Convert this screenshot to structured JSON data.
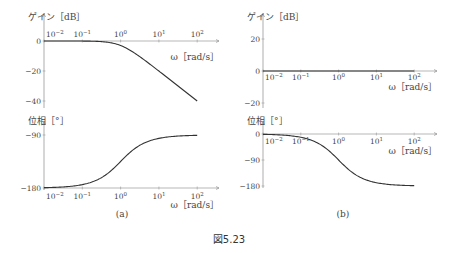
{
  "figure": {
    "caption": "図5.23",
    "panels": [
      {
        "id": "a",
        "label": "(a)"
      },
      {
        "id": "b",
        "label": "(b)"
      }
    ]
  },
  "chart_data": [
    {
      "type": "line",
      "panel": "(a)",
      "title": "ゲイン [dB]",
      "xlabel": "ω [rad/s]",
      "ylabel": "ゲイン [dB]",
      "xscale": "log",
      "xticks": [
        "10^-2",
        "10^-1",
        "10^0",
        "10^1",
        "10^2"
      ],
      "yticks": [
        0,
        -20,
        -40
      ],
      "ylim": [
        -45,
        0
      ],
      "x": [
        0.01,
        0.1,
        0.3,
        1,
        3,
        10,
        30,
        100
      ],
      "values": [
        0,
        -0.04,
        -0.4,
        -3,
        -10,
        -20,
        -29.5,
        -40
      ],
      "series_formula": "-10*log10(1+w^2)"
    },
    {
      "type": "line",
      "panel": "(a)",
      "title": "位相 [°]",
      "xlabel": "ω [rad/s]",
      "ylabel": "位相 [°]",
      "xscale": "log",
      "xticks": [
        "10^-2",
        "10^-1",
        "10^0",
        "10^1",
        "10^2"
      ],
      "yticks": [
        -90,
        -180
      ],
      "ylim": [
        -180,
        -90
      ],
      "x": [
        0.01,
        0.1,
        0.3,
        1,
        3,
        10,
        30,
        100
      ],
      "values": [
        -179.4,
        -174.3,
        -163.3,
        -135,
        -108.4,
        -95.7,
        -91.9,
        -90.6
      ],
      "series_formula": "-180+atan(w)"
    },
    {
      "type": "line",
      "panel": "(b)",
      "title": "ゲイン [dB]",
      "xlabel": "ω [rad/s]",
      "ylabel": "ゲイン [dB]",
      "xscale": "log",
      "xticks": [
        "10^-2",
        "10^-1",
        "10^0",
        "10^1",
        "10^2"
      ],
      "yticks": [
        20,
        0,
        -20
      ],
      "ylim": [
        -20,
        20
      ],
      "x": [
        0.01,
        100
      ],
      "values": [
        0,
        0
      ],
      "series_formula": "0"
    },
    {
      "type": "line",
      "panel": "(b)",
      "title": "位相 [°]",
      "xlabel": "ω [rad/s]",
      "ylabel": "位相 [°]",
      "xscale": "log",
      "xticks": [
        "10^-2",
        "10^-1",
        "10^0",
        "10^1",
        "10^2"
      ],
      "yticks": [
        0,
        -90,
        -180
      ],
      "ylim": [
        -180,
        0
      ],
      "x": [
        0.01,
        0.1,
        0.3,
        1,
        3,
        10,
        30,
        100
      ],
      "values": [
        -1.1,
        -11.4,
        -33.4,
        -90,
        -143.1,
        -168.6,
        -176.2,
        -178.9
      ],
      "series_formula": "-2*atan(w)"
    }
  ],
  "labels": {
    "gain": "ゲイン［dB］",
    "phase": "位相［°］",
    "omega": "ω［rad/s］"
  }
}
